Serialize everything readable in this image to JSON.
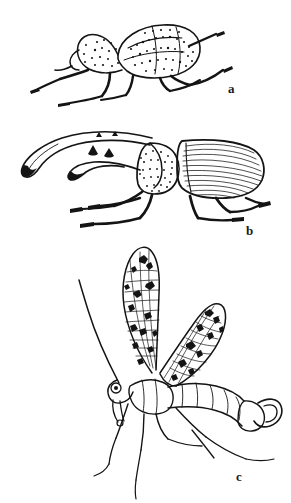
{
  "plate": {
    "title": "Insect line-drawing plate",
    "background_color": "#ffffff",
    "ink_color": "#141414",
    "width": 291,
    "height": 503,
    "figure_count": 3
  },
  "figures": [
    {
      "label": "a",
      "name": "weevil-snout-beetle",
      "caption_text": "a",
      "description": "Weevil (snout beetle) in right lateral view, body tilted with head down-left, mottled stippled elytra, six legs",
      "label_position": {
        "x": 228,
        "y": 82
      }
    },
    {
      "label": "b",
      "name": "hercules-rhinoceros-beetle",
      "caption_text": "b",
      "description": "Male hercules / rhinoceros beetle in left lateral view with long curved cephalic horn, toothed thoracic horn and finely striated elytra",
      "label_position": {
        "x": 246,
        "y": 224
      }
    },
    {
      "label": "c",
      "name": "scorpionfly",
      "caption_text": "c",
      "description": "Male scorpionfly (Mecoptera) with two raised spotted membranous wings, long filiform antenna and upcurved bulbous genital capsule",
      "label_position": {
        "x": 236,
        "y": 470
      }
    }
  ]
}
